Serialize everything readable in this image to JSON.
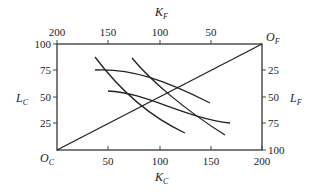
{
  "diagram": {
    "type": "edgeworth-box",
    "origins": {
      "bottom_left": {
        "main": "O",
        "sub": "C"
      },
      "top_right": {
        "main": "O",
        "sub": "F"
      }
    },
    "axes": {
      "bottom": {
        "label_main": "K",
        "label_sub": "C",
        "ticks": [
          "50",
          "100",
          "150",
          "200"
        ]
      },
      "top": {
        "label_main": "K",
        "label_sub": "F",
        "ticks": [
          "200",
          "150",
          "100",
          "50"
        ]
      },
      "left": {
        "label_main": "L",
        "label_sub": "C",
        "ticks": [
          "100",
          "75",
          "50",
          "25"
        ]
      },
      "right": {
        "label_main": "L",
        "label_sub": "F",
        "ticks": [
          "25",
          "50",
          "75",
          "100"
        ]
      }
    },
    "curves": [
      {
        "name": "isoquant-c-1",
        "points": [
          [
            95,
            57
          ],
          [
            110,
            77
          ],
          [
            125,
            95
          ],
          [
            145,
            113
          ],
          [
            165,
            126
          ],
          [
            185,
            133
          ]
        ]
      },
      {
        "name": "isoquant-c-2",
        "points": [
          [
            132,
            58
          ],
          [
            145,
            73
          ],
          [
            160,
            88
          ],
          [
            180,
            105
          ],
          [
            205,
            122
          ],
          [
            225,
            135
          ]
        ]
      },
      {
        "name": "isoquant-f-1",
        "points": [
          [
            95,
            70
          ],
          [
            120,
            70
          ],
          [
            145,
            76
          ],
          [
            170,
            87
          ],
          [
            190,
            98
          ],
          [
            210,
            103
          ]
        ]
      },
      {
        "name": "isoquant-f-2",
        "points": [
          [
            108,
            91
          ],
          [
            130,
            93
          ],
          [
            155,
            101
          ],
          [
            180,
            112
          ],
          [
            205,
            120
          ],
          [
            230,
            123
          ]
        ]
      }
    ],
    "contract_curve": {
      "from": [
        57,
        150
      ],
      "to": [
        262,
        44
      ]
    }
  }
}
